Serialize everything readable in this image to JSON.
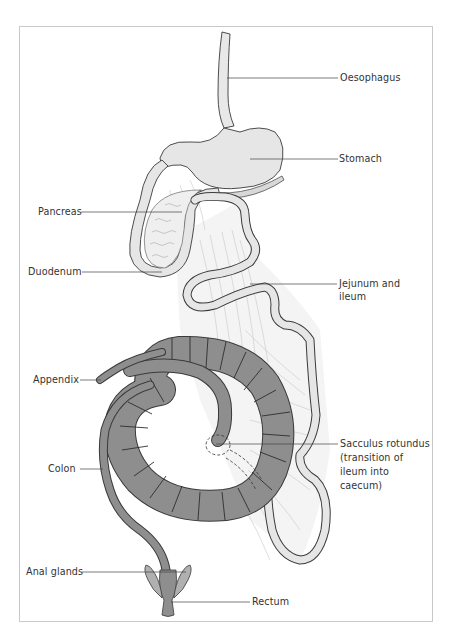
{
  "diagram": {
    "type": "anatomical-illustration",
    "colors": {
      "frame": "#c9c9c9",
      "outline": "#3a3a3a",
      "light_organ_fill": "#e6e6e6",
      "colon_fill": "#8e8e8e",
      "mesentery_lines": "#bdbdbd",
      "leader_line": "#444444",
      "label_text": "#333333"
    },
    "labels": {
      "oesophagus": "Oesophagus",
      "stomach": "Stomach",
      "pancreas": "Pancreas",
      "duodenum": "Duodenum",
      "jejunum_line1": "Jejunum and",
      "jejunum_line2": "ileum",
      "appendix": "Appendix",
      "colon": "Colon",
      "sacculus_line1": "Sacculus rotundus",
      "sacculus_line2": "(transition of",
      "sacculus_line3": "ileum into",
      "sacculus_line4": "caecum)",
      "anal_glands": "Anal glands",
      "rectum": "Rectum"
    }
  }
}
